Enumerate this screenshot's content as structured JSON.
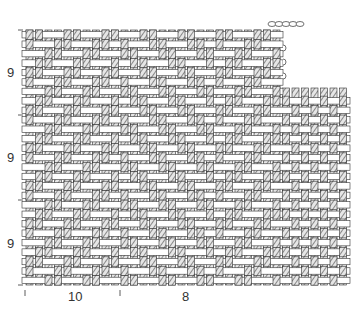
{
  "diagram": {
    "colors": {
      "outline": "#333333",
      "hatch": "#555555",
      "weft_fill": "#ffffff",
      "warp_fill": "#e6e6e6"
    },
    "left_labels": [
      "9",
      "9",
      "9"
    ],
    "bottom_labels": [
      "10",
      "8"
    ],
    "regions": [
      {
        "name": "twill-region",
        "pattern": "twill",
        "repeat_warps": 10,
        "repeat_wefts": 9
      },
      {
        "name": "plain-region",
        "pattern": "plain",
        "repeat_warps": 8
      }
    ]
  }
}
